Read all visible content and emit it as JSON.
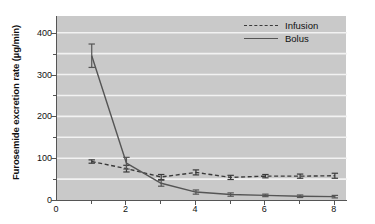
{
  "chart_data": {
    "type": "line",
    "title": "",
    "subtitle": "",
    "xlabel": "",
    "ylabel": "Furosemide excretion rate (µg/min)",
    "xlim": [
      0,
      8.35
    ],
    "ylim": [
      0,
      440
    ],
    "xticks": [
      0,
      2,
      4,
      6,
      8
    ],
    "xtick_labels": [
      "0",
      "2",
      "4",
      "6",
      "8"
    ],
    "xticks_minor": [
      1,
      3,
      5,
      7
    ],
    "yticks": [
      0,
      100,
      200,
      300,
      400
    ],
    "ytick_labels": [
      "0",
      "100",
      "200",
      "300",
      "400"
    ],
    "yticks_minor": [
      50,
      150,
      250,
      350
    ],
    "gridlines": "horizontal-white-at-50-unit-intervals",
    "grid": true,
    "legend_position": "top-right",
    "plot_background": "#c9c9c9",
    "series": [
      {
        "name": "Infusion",
        "style": "dashed",
        "color": "#3a3a3a",
        "x": [
          1,
          2,
          3,
          4,
          5,
          6,
          7,
          8
        ],
        "values": [
          92,
          75,
          55,
          66,
          54,
          57,
          57,
          58
        ],
        "error": [
          4,
          8,
          6,
          6,
          5,
          4,
          5,
          6
        ]
      },
      {
        "name": "Bolus",
        "style": "solid",
        "color": "#555555",
        "x": [
          1,
          2,
          3,
          4,
          5,
          6,
          7,
          8
        ],
        "values": [
          345,
          88,
          40,
          19,
          13,
          11,
          9,
          8
        ],
        "error": [
          28,
          14,
          7,
          5,
          4,
          3,
          3,
          3
        ]
      }
    ]
  },
  "legend": {
    "items": [
      {
        "label": "Infusion",
        "style": "dashed"
      },
      {
        "label": "Bolus",
        "style": "solid"
      }
    ]
  },
  "axes": {
    "y_title": "Furosemide excretion rate (µg/min)"
  }
}
